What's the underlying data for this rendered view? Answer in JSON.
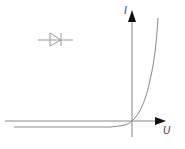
{
  "diagram": {
    "axes": {
      "x_label": "U",
      "y_label": "I"
    },
    "symbol": "diode-icon",
    "colors": {
      "axis": "#555555",
      "curve": "#888888",
      "symbol": "#999999"
    }
  }
}
